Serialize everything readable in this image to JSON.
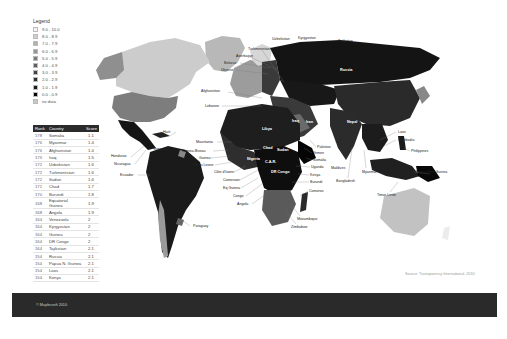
{
  "legend": {
    "title": "Legend",
    "items": [
      {
        "label": "9.0 - 10.0",
        "color": "#f4f4f4"
      },
      {
        "label": "8.0 - 8.9",
        "color": "#cfcfcf"
      },
      {
        "label": "7.0 - 7.9",
        "color": "#b0b0b0"
      },
      {
        "label": "6.0 - 6.9",
        "color": "#949494"
      },
      {
        "label": "5.0 - 5.9",
        "color": "#7a7a7a"
      },
      {
        "label": "4.0 - 4.9",
        "color": "#5e5e5e"
      },
      {
        "label": "3.0 - 3.9",
        "color": "#444444"
      },
      {
        "label": "2.0 - 2.9",
        "color": "#2e2e2e"
      },
      {
        "label": "1.0 - 1.9",
        "color": "#1a1a1a"
      },
      {
        "label": "0.0 - 0.9",
        "color": "#050505"
      },
      {
        "label": "no data",
        "color": "#c8c8c8"
      }
    ]
  },
  "table": {
    "headers": {
      "rank": "Rank",
      "country": "Country",
      "score": "Score"
    },
    "rows": [
      {
        "rank": "178",
        "country": "Somalia",
        "score": "1.1"
      },
      {
        "rank": "176",
        "country": "Myanmar",
        "score": "1.4"
      },
      {
        "rank": "176",
        "country": "Afghanistan",
        "score": "1.4"
      },
      {
        "rank": "175",
        "country": "Iraq",
        "score": "1.5"
      },
      {
        "rank": "172",
        "country": "Uzbekistan",
        "score": "1.6"
      },
      {
        "rank": "172",
        "country": "Turkmenistan",
        "score": "1.6"
      },
      {
        "rank": "172",
        "country": "Sudan",
        "score": "1.6"
      },
      {
        "rank": "171",
        "country": "Chad",
        "score": "1.7"
      },
      {
        "rank": "170",
        "country": "Burundi",
        "score": "1.8"
      },
      {
        "rank": "168",
        "country": "Equatorial Guinea",
        "score": "1.9"
      },
      {
        "rank": "168",
        "country": "Angola",
        "score": "1.9"
      },
      {
        "rank": "164",
        "country": "Venezuela",
        "score": "2"
      },
      {
        "rank": "164",
        "country": "Kyrgyzstan",
        "score": "2"
      },
      {
        "rank": "164",
        "country": "Guinea",
        "score": "2"
      },
      {
        "rank": "164",
        "country": "DR Congo",
        "score": "2"
      },
      {
        "rank": "164",
        "country": "Tajikistan",
        "score": "2.1"
      },
      {
        "rank": "154",
        "country": "Russia",
        "score": "2.1"
      },
      {
        "rank": "154",
        "country": "Papua N. Guinea",
        "score": "2.1"
      },
      {
        "rank": "154",
        "country": "Laos",
        "score": "2.1"
      },
      {
        "rank": "154",
        "country": "Kenya",
        "score": "2.1"
      }
    ]
  },
  "map_labels": {
    "uzbekistan": "Uzbekistan",
    "kyrgyzstan": "Kyrgyzstan",
    "tajikistan": "Tajikistan",
    "turkmenistan": "Turkmenistan",
    "azerbaijan": "Azerbaijan",
    "belarus": "Belarus",
    "ukraine": "Ukraine",
    "russia": "Russia",
    "afghanistan": "Afghanistan",
    "lebanon": "Lebanon",
    "iraq": "Iraq",
    "iran": "Iran",
    "nepal": "Nepal",
    "haiti": "Haiti",
    "venezuela": "Venezuela",
    "honduras": "Honduras",
    "nicaragua": "Nicaragua",
    "ecuador": "Ecuador",
    "paraguay": "Paraguay",
    "mauritania": "Mauritania",
    "guinea_bissau": "Guinea-Bissau",
    "guinea": "Guinea",
    "sierra_leone": "Sierra Leone",
    "cote_divoire": "Côte d'Ivoire",
    "cameroon": "Cameroon",
    "eq_guinea": "Eq Guinea",
    "congo": "Congo",
    "angola": "Angola",
    "libya": "Libya",
    "chad": "Chad",
    "sudan": "Sudan",
    "nigeria": "Nigeria",
    "car": "C.A.R.",
    "dr_congo": "DR Congo",
    "pakistan": "Pakistan",
    "yemen": "Yemen",
    "somalia": "Somalia",
    "uganda": "Uganda",
    "kenya": "Kenya",
    "burundi": "Burundi",
    "comoros": "Comoros",
    "mozambique": "Mozambique",
    "zimbabwe": "Zimbabwe",
    "maldives": "Maldives",
    "bangladesh": "Bangladesh",
    "myanmar": "Myanmar",
    "laos": "Laos",
    "cambodia": "Cambodia",
    "philippines": "Philippines",
    "papua_new_guinea": "Papua New Guinea",
    "timor_leste": "Timor-Leste"
  },
  "source": "Source: Transparency International, 2010",
  "footer": {
    "copyright": "© Maplecroft 2010",
    "color": "#2a2a2a"
  }
}
